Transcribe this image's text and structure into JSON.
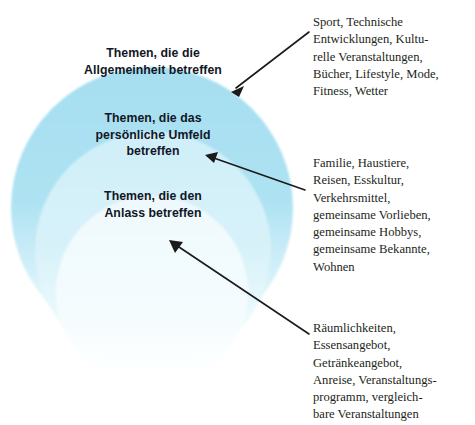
{
  "diagram": {
    "type": "nested-circles",
    "title_present": false,
    "palette": {
      "outer_ring": "#a6dff1",
      "middle_ring": "#d2f0f8",
      "inner_circle": "#f2fbfe",
      "label_text": "#111726",
      "note_text": "#231f20",
      "arrow": "#1a1a1a",
      "background": "#ffffff"
    },
    "rings": [
      {
        "id": "outer",
        "level": 1,
        "label": "Themen, die die\nAllgemeinheit betreffen",
        "fill": "#a6dff1",
        "note_id": "note-1"
      },
      {
        "id": "middle",
        "level": 2,
        "label": "Themen, die das\npersönliche Umfeld\nbetreffen",
        "fill": "#d2f0f8",
        "note_id": "note-2"
      },
      {
        "id": "inner",
        "level": 3,
        "label": "Themen, die den\nAnlass betreffen",
        "fill": "#f2fbfe",
        "note_id": "note-3"
      }
    ],
    "notes": [
      {
        "id": "note-1",
        "target_ring": "outer",
        "text": "Sport, Technische\nEntwicklungen, Kultu-\nrelle Veranstaltungen,\nBücher, Lifestyle, Mode,\nFitness, Wetter",
        "items": [
          "Sport",
          "Technische Entwicklungen",
          "Kulturelle Veranstaltungen",
          "Bücher",
          "Lifestyle",
          "Mode",
          "Fitness",
          "Wetter"
        ]
      },
      {
        "id": "note-2",
        "target_ring": "middle",
        "text": "Familie, Haustiere,\nReisen, Esskultur,\nVerkehrsmittel,\ngemeinsame Vorlieben,\ngemeinsame Hobbys,\ngemeinsame Bekannte,\nWohnen",
        "items": [
          "Familie",
          "Haustiere",
          "Reisen",
          "Esskultur",
          "Verkehrsmittel",
          "gemeinsame Vorlieben",
          "gemeinsame Hobbys",
          "gemeinsame Bekannte",
          "Wohnen"
        ]
      },
      {
        "id": "note-3",
        "target_ring": "inner",
        "text": "Räumlichkeiten,\nEssensangebot,\nGetränkeangebot,\nAnreise, Veranstaltungs-\nprogramm, vergleich-\nbare Veranstaltungen",
        "items": [
          "Räumlichkeiten",
          "Essensangebot",
          "Getränkeangebot",
          "Anreise",
          "Veranstaltungsprogramm",
          "vergleichbare Veranstaltungen"
        ]
      }
    ],
    "connectors": [
      {
        "id": "arrow-to-outer",
        "from": [
          309,
          32
        ],
        "to": [
          231,
          92
        ],
        "head_at": "to"
      },
      {
        "id": "arrow-to-middle",
        "from": [
          305,
          190
        ],
        "to": [
          205,
          155
        ],
        "head_at": "to"
      },
      {
        "id": "arrow-to-inner",
        "from": [
          309,
          334
        ],
        "to": [
          169,
          240
        ],
        "head_at": "to"
      }
    ]
  }
}
